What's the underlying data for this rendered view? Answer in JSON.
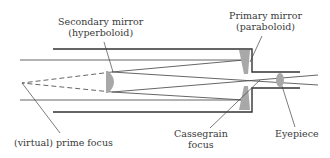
{
  "diagram": {
    "labels": {
      "secondary_mirror": {
        "line1": "Secondary mirror",
        "line2": "(hyperboloid)"
      },
      "primary_mirror": {
        "line1": "Primary mirror",
        "line2": "(paraboloid)"
      },
      "virtual_prime_focus": "(virtual) prime focus",
      "cassegrain_focus": {
        "line1": "Cassegrain",
        "line2": "focus"
      },
      "eyepiece": "Eyepiece"
    },
    "colors": {
      "tube": "#333333",
      "rays": "#555555",
      "mirror_fill": "#a8a8a8",
      "text": "#3a3a3a"
    }
  }
}
